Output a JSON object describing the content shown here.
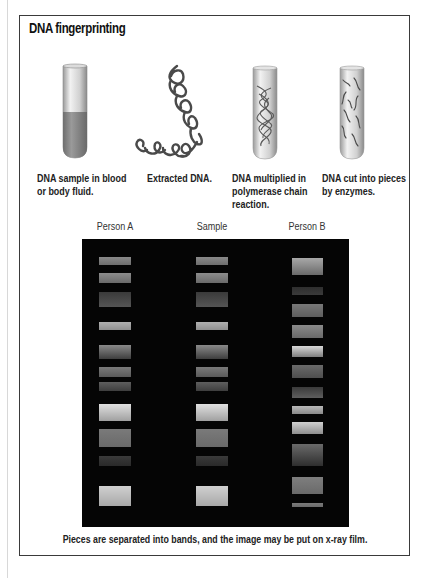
{
  "title": "DNA fingerprinting",
  "steps": [
    {
      "icon": "test-tube-blood-icon",
      "caption": [
        "DNA sample in blood",
        "or body fluid."
      ]
    },
    {
      "icon": "dna-helix-icon",
      "caption": [
        "Extracted DNA."
      ]
    },
    {
      "icon": "test-tube-pcr-icon",
      "caption": [
        "DNA multiplied in",
        "polymerase chain",
        "reaction."
      ]
    },
    {
      "icon": "test-tube-fragments-icon",
      "caption": [
        "DNA cut into pieces",
        "by enzymes."
      ]
    }
  ],
  "gel": {
    "lanes": [
      {
        "label": "Person A",
        "x": 17,
        "width": 32,
        "bands": [
          {
            "y": 18,
            "h": 8,
            "c1": "#8a8a8a",
            "c2": "#6e6e6e"
          },
          {
            "y": 34,
            "h": 10,
            "c1": "#8c8c8c",
            "c2": "#6a6a6a"
          },
          {
            "y": 53,
            "h": 15,
            "c1": "#3a3a3a",
            "c2": "#555555"
          },
          {
            "y": 83,
            "h": 8,
            "c1": "#b0b0b0",
            "c2": "#909090"
          },
          {
            "y": 106,
            "h": 14,
            "c1": "#8a8a8a",
            "c2": "#3e3e3e"
          },
          {
            "y": 128,
            "h": 10,
            "c1": "#7a7a7a",
            "c2": "#5a5a5a"
          },
          {
            "y": 143,
            "h": 9,
            "c1": "#5e5e5e",
            "c2": "#3e3e3e"
          },
          {
            "y": 165,
            "h": 17,
            "c1": "#e0e0e0",
            "c2": "#a0a0a0"
          },
          {
            "y": 190,
            "h": 18,
            "c1": "#7a7a7a",
            "c2": "#6a6a6a"
          },
          {
            "y": 217,
            "h": 10,
            "c1": "#3a3a3a",
            "c2": "#2a2a2a"
          },
          {
            "y": 247,
            "h": 20,
            "c1": "#d0d0d0",
            "c2": "#a8a8a8"
          }
        ]
      },
      {
        "label": "Sample",
        "x": 114,
        "width": 32,
        "bands": [
          {
            "y": 18,
            "h": 8,
            "c1": "#8a8a8a",
            "c2": "#6e6e6e"
          },
          {
            "y": 34,
            "h": 10,
            "c1": "#8c8c8c",
            "c2": "#6a6a6a"
          },
          {
            "y": 53,
            "h": 15,
            "c1": "#3a3a3a",
            "c2": "#555555"
          },
          {
            "y": 83,
            "h": 8,
            "c1": "#b0b0b0",
            "c2": "#909090"
          },
          {
            "y": 106,
            "h": 14,
            "c1": "#8a8a8a",
            "c2": "#3e3e3e"
          },
          {
            "y": 128,
            "h": 10,
            "c1": "#7a7a7a",
            "c2": "#5a5a5a"
          },
          {
            "y": 143,
            "h": 9,
            "c1": "#5e5e5e",
            "c2": "#3e3e3e"
          },
          {
            "y": 165,
            "h": 17,
            "c1": "#e0e0e0",
            "c2": "#a0a0a0"
          },
          {
            "y": 190,
            "h": 18,
            "c1": "#7a7a7a",
            "c2": "#6a6a6a"
          },
          {
            "y": 217,
            "h": 10,
            "c1": "#3a3a3a",
            "c2": "#2a2a2a"
          },
          {
            "y": 247,
            "h": 20,
            "c1": "#d0d0d0",
            "c2": "#a8a8a8"
          }
        ]
      },
      {
        "label": "Person B",
        "x": 210,
        "width": 31,
        "bands": [
          {
            "y": 19,
            "h": 17,
            "c1": "#a8a8a8",
            "c2": "#6a6a6a"
          },
          {
            "y": 48,
            "h": 8,
            "c1": "#2e2e2e",
            "c2": "#3a3a3a"
          },
          {
            "y": 65,
            "h": 13,
            "c1": "#787878",
            "c2": "#5e5e5e"
          },
          {
            "y": 86,
            "h": 13,
            "c1": "#8a8a8a",
            "c2": "#6a6a6a"
          },
          {
            "y": 107,
            "h": 11,
            "c1": "#d8d8d8",
            "c2": "#7e7e7e"
          },
          {
            "y": 126,
            "h": 13,
            "c1": "#6a6a6a",
            "c2": "#4e4e4e"
          },
          {
            "y": 148,
            "h": 11,
            "c1": "#3a3a3a",
            "c2": "#5e5e5e"
          },
          {
            "y": 167,
            "h": 8,
            "c1": "#b8b8b8",
            "c2": "#8a8a8a"
          },
          {
            "y": 183,
            "h": 12,
            "c1": "#d0d0d0",
            "c2": "#8e8e8e"
          },
          {
            "y": 205,
            "h": 22,
            "c1": "#6a6a6a",
            "c2": "#2e2e2e"
          },
          {
            "y": 238,
            "h": 17,
            "c1": "#7e7e7e",
            "c2": "#6a6a6a"
          },
          {
            "y": 264,
            "h": 4,
            "c1": "#7a7a7a",
            "c2": "#6a6a6a"
          }
        ]
      }
    ],
    "caption": "Pieces are separated into bands, and the image may be put on x-ray film."
  }
}
